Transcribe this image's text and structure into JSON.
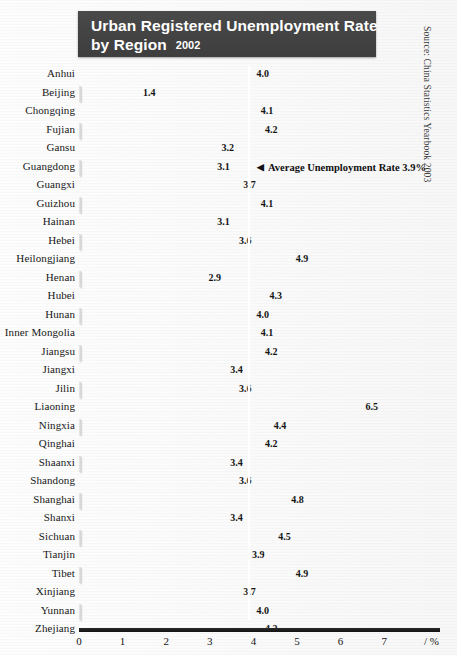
{
  "title": {
    "line1": "Urban Registered Unemployment Rate",
    "line2": "by Region",
    "year": "2002"
  },
  "source": "Source: China Statistics Yearbook 2003",
  "annotation": {
    "arrow": "◀",
    "text": "Average Unemployment Rate 3.9%"
  },
  "axis": {
    "ticks": [
      "0",
      "1",
      "2",
      "3",
      "4",
      "5",
      "6",
      "7"
    ],
    "unit": "/ %"
  },
  "colors": {
    "banner": "#434343",
    "bar_dark": "#cfcfcf",
    "bar_light": "#f7f7f7",
    "average_line": "#ffffff",
    "text": "#141414"
  },
  "chart_data": {
    "type": "bar",
    "orientation": "horizontal",
    "xlabel": "/ %",
    "ylabel": "",
    "xlim": [
      0,
      7.6
    ],
    "xticks": [
      0,
      1,
      2,
      3,
      4,
      5,
      6,
      7
    ],
    "grid": false,
    "legend": null,
    "annotations": [
      {
        "type": "vline",
        "value": 3.9,
        "label": "Average Unemployment Rate 3.9%"
      }
    ],
    "categories": [
      "Anhui",
      "Beijing",
      "Chongqing",
      "Fujian",
      "Gansu",
      "Guangdong",
      "Guangxi",
      "Guizhou",
      "Hainan",
      "Hebei",
      "Heilongjiang",
      "Henan",
      "Hubei",
      "Hunan",
      "Inner Mongolia",
      "Jiangsu",
      "Jiangxi",
      "Jilin",
      "Liaoning",
      "Ningxia",
      "Qinghai",
      "Shaanxi",
      "Shandong",
      "Shanghai",
      "Shanxi",
      "Sichuan",
      "Tianjin",
      "Tibet",
      "Xinjiang",
      "Yunnan",
      "Zhejiang"
    ],
    "values": [
      4.0,
      1.4,
      4.1,
      4.2,
      3.2,
      3.1,
      3.7,
      4.1,
      3.1,
      3.6,
      4.9,
      2.9,
      4.3,
      4.0,
      4.1,
      4.2,
      3.4,
      3.6,
      6.5,
      4.4,
      4.2,
      3.4,
      3.6,
      4.8,
      3.4,
      4.5,
      3.9,
      4.9,
      3.7,
      4.0,
      4.2
    ],
    "value_labels": [
      "4.0",
      "1.4",
      "4.1",
      "4.2",
      "3.2",
      "3.1",
      "3.7",
      "4.1",
      "3.1",
      "3.6",
      "4.9",
      "2.9",
      "4.3",
      "4.0",
      "4.1",
      "4.2",
      "3.4",
      "3.6",
      "6.5",
      "4.4",
      "4.2",
      "3.4",
      "3.6",
      "4.8",
      "3.4",
      "4.5",
      "3.9",
      "4.9",
      "3.7",
      "4.0",
      "4.2"
    ]
  }
}
